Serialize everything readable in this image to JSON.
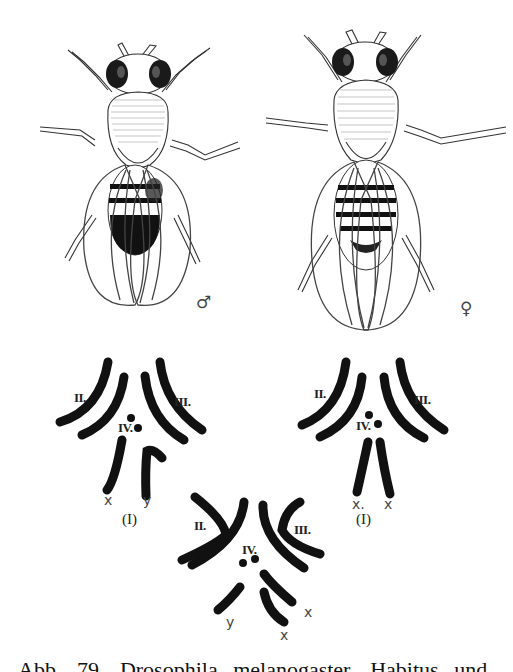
{
  "figure": {
    "subject": "Drosophila melanogaster",
    "panels": {
      "male_fly": {
        "sex_symbol": "♂"
      },
      "female_fly": {
        "sex_symbol": "♀"
      }
    },
    "karyotypes": [
      {
        "name": "male",
        "group_label": "(I)",
        "chromosome_labels": [
          "II.",
          "III.",
          "IV."
        ],
        "sex_chromosomes": [
          "x",
          "y"
        ]
      },
      {
        "name": "female",
        "group_label": "(I)",
        "chromosome_labels": [
          "II.",
          "III.",
          "IV."
        ],
        "sex_chromosomes": [
          "x.",
          "x"
        ]
      },
      {
        "name": "xxy",
        "chromosome_labels": [
          "II.",
          "III.",
          "IV."
        ],
        "sex_chromosomes": [
          "y",
          "x",
          "x"
        ]
      }
    ],
    "caption": "Abb. 79. Drosophila melanogaster. Habitus und"
  }
}
